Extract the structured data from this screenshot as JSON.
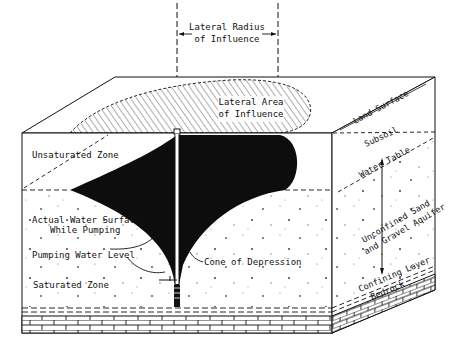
{
  "diagram": {
    "colors": {
      "ink": "#111111",
      "background": "#ffffff",
      "cone_fill": "#0d0d0d",
      "hatch": "#333333"
    },
    "labels": {
      "lateral_radius_line1": "Lateral Radius",
      "lateral_radius_line2": "of Influence",
      "lateral_area_line1": "Lateral Area",
      "lateral_area_line2": "of Influence",
      "land_surface": "Land Surface",
      "subsoil": "Subsoil",
      "water_table": "Water Table",
      "aquifer_line1": "Unconfined Sand",
      "aquifer_line2": "and Gravel Aquifer",
      "confining_layer": "Confining Layer",
      "bedrock": "Bedrock",
      "unsaturated_zone": "Unsaturated Zone",
      "actual_water_surface_line1": "Actual Water Surface",
      "actual_water_surface_line2": "While Pumping",
      "cone_of_depression": "Cone of Depression",
      "pumping_water_level": "Pumping Water Level",
      "saturated_zone": "Saturated Zone"
    }
  }
}
